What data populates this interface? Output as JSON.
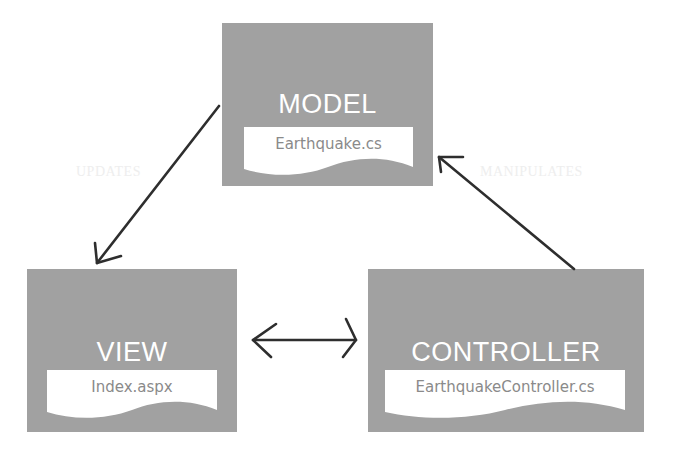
{
  "diagram": {
    "nodes": [
      {
        "id": "model",
        "title": "MODEL",
        "file": "Earthquake.cs"
      },
      {
        "id": "view",
        "title": "VIEW",
        "file": "Index.aspx"
      },
      {
        "id": "controller",
        "title": "CONTROLLER",
        "file": "EarthquakeController.cs"
      }
    ],
    "edges": [
      {
        "from": "model",
        "to": "view",
        "label": "UPDATES",
        "direction": "one-way"
      },
      {
        "from": "controller",
        "to": "model",
        "label": "MANIPULATES",
        "direction": "one-way"
      },
      {
        "from": "view",
        "to": "controller",
        "label": "",
        "direction": "two-way"
      }
    ],
    "colors": {
      "box": "#a1a1a1",
      "box_title": "#ffffff",
      "doc_fill": "#ffffff",
      "doc_text": "#8a8a8a",
      "arrow": "#2e2e2e",
      "edge_label": "#eeeeee"
    }
  }
}
